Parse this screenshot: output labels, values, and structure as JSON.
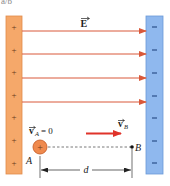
{
  "figure": {
    "top_fragment": "a/b",
    "field_label": "E",
    "velocity_a_label": "v",
    "velocity_a_sub": "A",
    "velocity_a_value": "= 0",
    "velocity_b_label": "v",
    "velocity_b_sub": "B",
    "point_a_label": "A",
    "point_b_label": "B",
    "distance_label": "d",
    "charge_sign": "+",
    "positive_sign": "+",
    "negative_sign": "−"
  },
  "colors": {
    "positive_plate": "#f5a86a",
    "positive_plate_border": "#e08a4a",
    "negative_plate": "#8fb8ee",
    "negative_plate_border": "#6a9ad8",
    "field_line": "#d9593a",
    "velocity_arrow": "#e0332a",
    "charge_fill": "#ef8a4e",
    "charge_border": "#c9602a",
    "sign_color": "#6a3a1a",
    "minus_color": "#2a4f8a",
    "text": "#222222"
  },
  "layout": {
    "plus_signs_y": [
      27,
      50,
      72,
      95,
      117,
      140,
      163
    ],
    "minus_signs_y": [
      27,
      50,
      73,
      96,
      118,
      141,
      163
    ],
    "field_lines_y": [
      31,
      54,
      78,
      102
    ]
  }
}
